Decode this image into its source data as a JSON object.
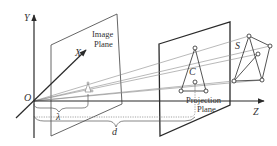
{
  "diagram": {
    "axes": {
      "y_label": "Y",
      "x_label": "X",
      "z_label": "Z",
      "origin_label": "O"
    },
    "image_plane": {
      "label_line1": "Image",
      "label_line2": "Plane"
    },
    "projection_plane": {
      "label_line1": "Projection",
      "label_line2": "Plane",
      "centroid_label": "C"
    },
    "object": {
      "label": "S"
    },
    "distances": {
      "focal_label": "λ",
      "plane_distance_label": "d"
    },
    "colors": {
      "stroke_dark": "#2a2a2a",
      "stroke_light": "#8a8a8a",
      "background": "#ffffff"
    }
  }
}
